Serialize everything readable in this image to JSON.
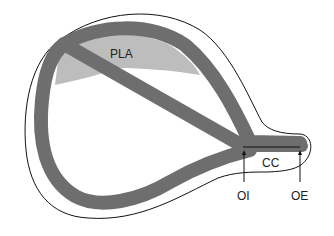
{
  "diagram": {
    "labels": {
      "pla": "PLA",
      "cc": "CC",
      "oi": "OI",
      "oe": "OE"
    },
    "colors": {
      "wall": "#6e6e6e",
      "pla_fill": "#bdbdbd",
      "outline": "#111111",
      "background": "#ffffff"
    }
  }
}
